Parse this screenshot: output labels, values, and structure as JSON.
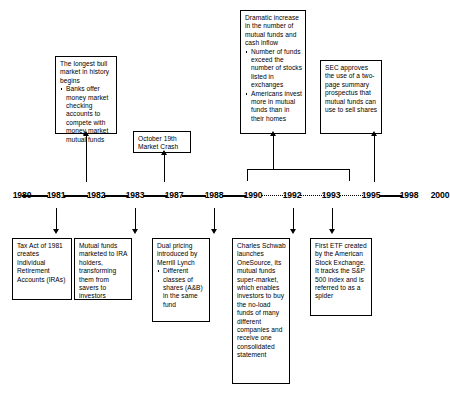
{
  "diagram": {
    "type": "timeline",
    "axis_years": [
      "1980",
      "1981",
      "1982",
      "1983",
      "1987",
      "1988",
      "1990",
      "1992",
      "1993",
      "1995",
      "1998",
      "2000"
    ],
    "connector_styles": [
      "solid",
      "solid",
      "solid",
      "solid",
      "solid",
      "solid",
      "dotted",
      "dotted",
      "dotted",
      "solid",
      "solid"
    ]
  },
  "years": {
    "y1980": "1980",
    "y1981": "1981",
    "y1982": "1982",
    "y1983": "1983",
    "y1987": "1987",
    "y1988": "1988",
    "y1990": "1990",
    "y1992": "1992",
    "y1993": "1993",
    "y1995": "1995",
    "y1998": "1998",
    "y2000": "2000"
  },
  "events_above": {
    "bull_market": {
      "anchor_year": "1982",
      "heading": "The longest bull market in history begins",
      "bullets": [
        "Banks offer money market checking accounts to compete with money market mutual funds"
      ]
    },
    "market_crash": {
      "anchor_year": "1987",
      "heading": "October 19th Market Crash",
      "bullets": []
    },
    "dramatic_increase": {
      "anchor_year": "1990-1995",
      "heading": "Dramatic increase in the number of mutual funds and cash inflow",
      "bullets": [
        "Number of funds exceed the number of stocks listed in exchanges",
        "Americans invest more in mutual funds than in their homes"
      ]
    },
    "sec_prospectus": {
      "anchor_year": "1995",
      "heading": "SEC approves the use of a two-page summary prospectus that mutual funds can use to sell shares",
      "bullets": []
    }
  },
  "events_below": {
    "tax_act": {
      "anchor_year": "1981",
      "heading": "Tax Act of 1981 creates Individual Retirement Accounts (IRAs)",
      "bullets": []
    },
    "ira_marketing": {
      "anchor_year": "1983",
      "heading": "Mutual funds marketed to IRA holders, transforming them from savers to investors",
      "bullets": []
    },
    "dual_pricing": {
      "anchor_year": "1988",
      "heading": "Dual pricing introduced by Merrill Lynch",
      "bullets": [
        "Different classes of shares (A&B) in the same fund"
      ]
    },
    "onesource": {
      "anchor_year": "1992",
      "heading": "Charles Schwab launches OneSource, its mutual funds super-market, which enables investors to buy the no-load funds of many different companies and receive one consolidated statement",
      "bullets": []
    },
    "first_etf": {
      "anchor_year": "1993",
      "heading": "First ETF created by the American Stock Exchange. It tracks the S&P 500 index and is referred to as a spider",
      "bullets": []
    }
  },
  "colors": {
    "line": "#000000",
    "background": "#ffffff",
    "text": "#000000"
  }
}
